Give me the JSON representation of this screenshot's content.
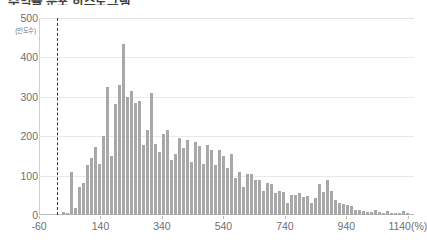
{
  "title": "수익률 분포 히스토그램",
  "chart_data": {
    "type": "bar",
    "title": "수익률 분포 히스토그램",
    "xlabel": "(%)",
    "ylabel": "(빈도수)",
    "y_unit": "(빈도수)",
    "x_unit": "(%)",
    "ylim": [
      0,
      500
    ],
    "xlim": [
      -60,
      1160
    ],
    "yticks": [
      0,
      100,
      200,
      300,
      400,
      500
    ],
    "ytick_labels": [
      "0",
      "100",
      "200",
      "300",
      "400",
      "500"
    ],
    "xticks": [
      -60,
      140,
      340,
      540,
      740,
      940,
      1140
    ],
    "xtick_labels": [
      "-60",
      "140",
      "340",
      "540",
      "740",
      "940",
      "1140(%)"
    ],
    "grid": true,
    "legend": null,
    "bar_color": "#a8a8a8",
    "annotations": [
      {
        "type": "vline",
        "x": 0,
        "style": "dashed",
        "color": "#3a3a3a",
        "label": ""
      }
    ],
    "bin_width": 13,
    "categories": [
      20,
      33,
      46,
      59,
      72,
      85,
      98,
      111,
      124,
      137,
      150,
      163,
      176,
      189,
      202,
      215,
      228,
      241,
      254,
      267,
      280,
      293,
      306,
      319,
      332,
      345,
      358,
      371,
      384,
      397,
      410,
      423,
      436,
      449,
      462,
      475,
      488,
      501,
      514,
      527,
      540,
      553,
      566,
      579,
      592,
      605,
      618,
      631,
      644,
      657,
      670,
      683,
      696,
      709,
      722,
      735,
      748,
      761,
      774,
      787,
      800,
      813,
      826,
      839,
      852,
      865,
      878,
      891,
      904,
      917,
      930,
      943,
      956,
      969,
      982,
      995,
      1008,
      1021,
      1034,
      1047,
      1060,
      1073,
      1086,
      1099,
      1112,
      1125,
      1138
    ],
    "values": [
      8,
      6,
      110,
      18,
      70,
      80,
      128,
      145,
      172,
      130,
      200,
      325,
      150,
      283,
      330,
      435,
      300,
      315,
      285,
      290,
      178,
      215,
      310,
      180,
      160,
      205,
      215,
      140,
      155,
      195,
      170,
      190,
      135,
      185,
      175,
      130,
      178,
      165,
      128,
      165,
      150,
      120,
      155,
      95,
      110,
      70,
      105,
      105,
      90,
      88,
      60,
      82,
      78,
      55,
      62,
      58,
      30,
      50,
      52,
      55,
      45,
      48,
      30,
      42,
      78,
      58,
      88,
      62,
      38,
      30,
      28,
      25,
      22,
      12,
      12,
      10,
      8,
      8,
      12,
      8,
      6,
      10,
      6,
      5,
      4,
      10,
      5
    ]
  }
}
